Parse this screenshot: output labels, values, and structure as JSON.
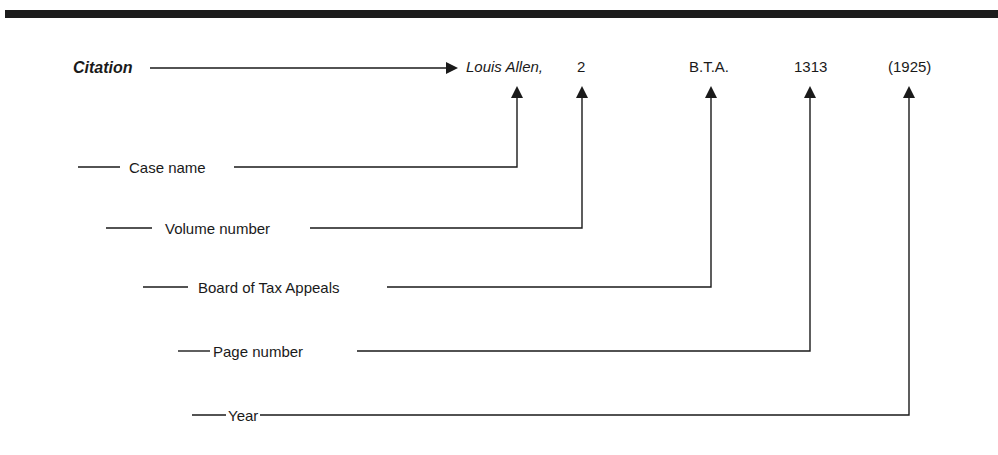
{
  "diagram": {
    "title_label": "Citation",
    "citation_parts": [
      {
        "id": "case",
        "text": "Louis Allen,",
        "italic": true
      },
      {
        "id": "volume",
        "text": "2",
        "italic": false
      },
      {
        "id": "reporter",
        "text": "B.T.A.",
        "italic": false
      },
      {
        "id": "page",
        "text": "1313",
        "italic": false
      },
      {
        "id": "year",
        "text": "(1925)",
        "italic": false
      }
    ],
    "labels": [
      {
        "id": "case",
        "text": "Case name"
      },
      {
        "id": "volume",
        "text": "Volume number"
      },
      {
        "id": "reporter",
        "text": "Board of Tax Appeals"
      },
      {
        "id": "page",
        "text": "Page number"
      },
      {
        "id": "year",
        "text": "Year"
      }
    ],
    "colors": {
      "line": "#1a1a1a",
      "background": "#ffffff"
    }
  }
}
